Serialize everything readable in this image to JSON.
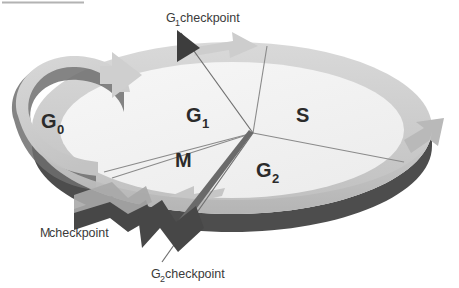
{
  "figure": {
    "type": "cycle-diagram"
  },
  "phases": [
    {
      "id": "g0",
      "label": "G",
      "sub": "0",
      "name": "G0 phase"
    },
    {
      "id": "g1",
      "label": "G",
      "sub": "1",
      "name": "G1 phase"
    },
    {
      "id": "s",
      "label": "S",
      "sub": "",
      "name": "S phase"
    },
    {
      "id": "g2",
      "label": "G",
      "sub": "2",
      "name": "G2 phase"
    },
    {
      "id": "m",
      "label": "M",
      "sub": "",
      "name": "M phase"
    }
  ],
  "checkpoints": [
    {
      "id": "g1cp",
      "label": "G",
      "sub": "1",
      "suffix": " checkpoint"
    },
    {
      "id": "mcp",
      "label": "M",
      "sub": "",
      "suffix": " checkpoint"
    },
    {
      "id": "g2cp",
      "label": "G",
      "sub": "2",
      "suffix": " checkpoint"
    }
  ],
  "colors": {
    "disc_fill": "#f1f1f1",
    "ring_light": "#d2d2d2",
    "ring_mid": "#bdbdbd",
    "ring_dark": "#4d4d4d",
    "wedge_dark": "#474747",
    "sector_line": "#8a8a8a",
    "text": "#2b2b2b",
    "rule": "#9a9a9a",
    "background": "#ffffff"
  }
}
